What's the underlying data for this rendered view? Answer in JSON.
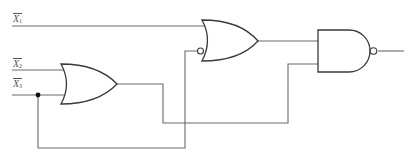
{
  "diagram": {
    "title": "",
    "inputs": [
      {
        "id": "x1",
        "name": "X",
        "sub": "1",
        "complemented": true,
        "label_pos": [
          13,
          14
        ],
        "wire_y": 26
      },
      {
        "id": "x2",
        "name": "X",
        "sub": "2",
        "complemented": true,
        "label_pos": [
          13,
          59
        ],
        "wire_y": 70
      },
      {
        "id": "x3",
        "name": "X",
        "sub": "3",
        "complemented": true,
        "label_pos": [
          13,
          78
        ],
        "wire_y": 95
      }
    ],
    "gates": [
      {
        "id": "or1",
        "type": "OR",
        "inputs": [
          "x2",
          "x3"
        ],
        "inverted_inputs": [],
        "output_inverted": false
      },
      {
        "id": "or2",
        "type": "OR",
        "inputs": [
          "x1",
          "x3"
        ],
        "inverted_inputs": [
          "x3"
        ],
        "output_inverted": false
      },
      {
        "id": "nand",
        "type": "AND",
        "inputs": [
          "or2",
          "or1"
        ],
        "inverted_inputs": [],
        "output_inverted": true
      }
    ],
    "junctions": [
      {
        "on": "x3",
        "pos": [
          38,
          95
        ]
      }
    ],
    "colors": {
      "wire": "#6a6a6a",
      "gate": "#3a3a3a",
      "label": "#555555",
      "background": "#ffffff"
    }
  }
}
